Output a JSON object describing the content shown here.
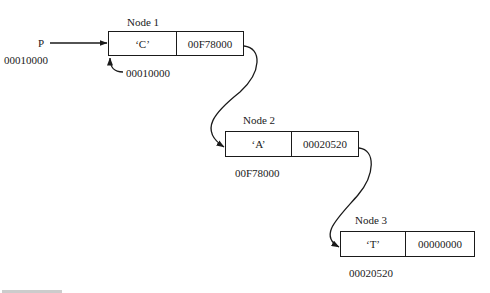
{
  "pointer": {
    "name": "P",
    "address": "00010000"
  },
  "nodes": [
    {
      "title": "Node 1",
      "data": "‘C’",
      "next": "00F78000",
      "self_address": "00010000"
    },
    {
      "title": "Node 2",
      "data": "‘A’",
      "next": "00020520",
      "self_address": "00F78000"
    },
    {
      "title": "Node 3",
      "data": "‘T’",
      "next": "00000000",
      "self_address": "00020520"
    }
  ],
  "colors": {
    "ink": "#1a1a1a",
    "background": "#ffffff"
  }
}
